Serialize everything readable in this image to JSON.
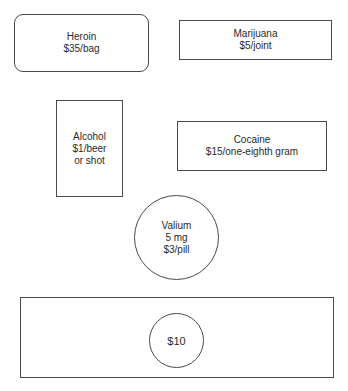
{
  "diagram": {
    "items": [
      {
        "id": "heroin",
        "shape": "rounded-rectangle",
        "name": "Heroin",
        "price": "$35/bag"
      },
      {
        "id": "marijuana",
        "shape": "rectangle",
        "name": "Marijuana",
        "price": "$5/joint"
      },
      {
        "id": "alcohol",
        "shape": "rectangle",
        "name": "Alcohol",
        "price_line1": "$1/beer",
        "price_line2": "or shot"
      },
      {
        "id": "cocaine",
        "shape": "rectangle",
        "name": "Cocaine",
        "price": "$15/one-eighth gram"
      },
      {
        "id": "valium",
        "shape": "circle",
        "name": "Valium",
        "dose": "5 mg",
        "price": "$3/pill"
      }
    ],
    "budget": {
      "shape": "rectangle-with-circle",
      "label": "$10"
    },
    "colors": {
      "stroke": "#4a4a4a",
      "text": "#2a2a2a",
      "background": "#ffffff"
    }
  }
}
